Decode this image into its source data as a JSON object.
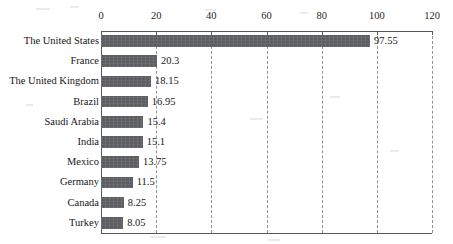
{
  "chart_data": {
    "type": "bar",
    "orientation": "horizontal",
    "title": "",
    "subtitle": "",
    "xlabel": "",
    "ylabel": "",
    "xlim": [
      0,
      120
    ],
    "xticks": [
      0,
      20,
      40,
      60,
      80,
      100,
      120
    ],
    "grid": "vertical-dashed",
    "legend": "none",
    "categories": [
      "The United States",
      "France",
      "The United Kingdom",
      "Brazil",
      "Saudi Arabia",
      "India",
      "Mexico",
      "Germany",
      "Canada",
      "Turkey"
    ],
    "values": [
      97.55,
      20.3,
      18.15,
      16.95,
      15.4,
      15.1,
      13.75,
      11.5,
      8.25,
      8.05
    ],
    "value_labels": [
      "97.55",
      "20.3",
      "18.15",
      "16.95",
      "15.4",
      "15.1",
      "13.75",
      "11.5",
      "8.25",
      "8.05"
    ],
    "series": [
      {
        "name": "",
        "values": [
          97.55,
          20.3,
          18.15,
          16.95,
          15.4,
          15.1,
          13.75,
          11.5,
          8.25,
          8.05
        ]
      }
    ]
  },
  "colors": {
    "bar_fill": "#5b5d60",
    "axis": "#55585c",
    "gridline": "#8f9296",
    "text": "#161616",
    "background": "#ffffff"
  }
}
